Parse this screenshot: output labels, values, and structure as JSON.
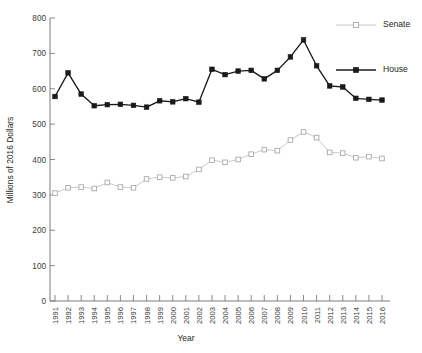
{
  "chart_data": {
    "type": "line",
    "title": "",
    "xlabel": "Year",
    "ylabel": "Millions of 2016 Dollars",
    "xlim": [
      1990.5,
      2016.5
    ],
    "ylim": [
      0,
      800
    ],
    "ytick_step": 100,
    "grid": false,
    "legend_position": "right",
    "categories": [
      "1991",
      "1992",
      "1993",
      "1994",
      "1995",
      "1996",
      "1997",
      "1998",
      "1999",
      "2000",
      "2001",
      "2002",
      "2003",
      "2004",
      "2005",
      "2006",
      "2007",
      "2008",
      "2009",
      "2010",
      "2011",
      "2012",
      "2013",
      "2014",
      "2015",
      "2016"
    ],
    "yticks": [
      "0",
      "100",
      "200",
      "300",
      "400",
      "500",
      "600",
      "700",
      "800"
    ],
    "series": [
      {
        "name": "Senate",
        "color": "#c9cacb",
        "marker": "open-square",
        "values": [
          305,
          320,
          322,
          318,
          335,
          322,
          320,
          345,
          350,
          348,
          352,
          372,
          398,
          392,
          400,
          415,
          428,
          425,
          455,
          478,
          462,
          420,
          418,
          405,
          408,
          403
        ]
      },
      {
        "name": "House",
        "color": "#1a1a1a",
        "marker": "filled-square",
        "values": [
          578,
          645,
          585,
          552,
          555,
          556,
          553,
          548,
          566,
          563,
          572,
          562,
          655,
          640,
          650,
          652,
          628,
          652,
          690,
          738,
          665,
          608,
          605,
          573,
          570,
          568
        ]
      }
    ]
  },
  "legend": {
    "items": [
      {
        "label": "Senate"
      },
      {
        "label": "House"
      }
    ]
  },
  "axes": {
    "y_title": "Millions of 2016 Dollars",
    "x_title": "Year"
  }
}
